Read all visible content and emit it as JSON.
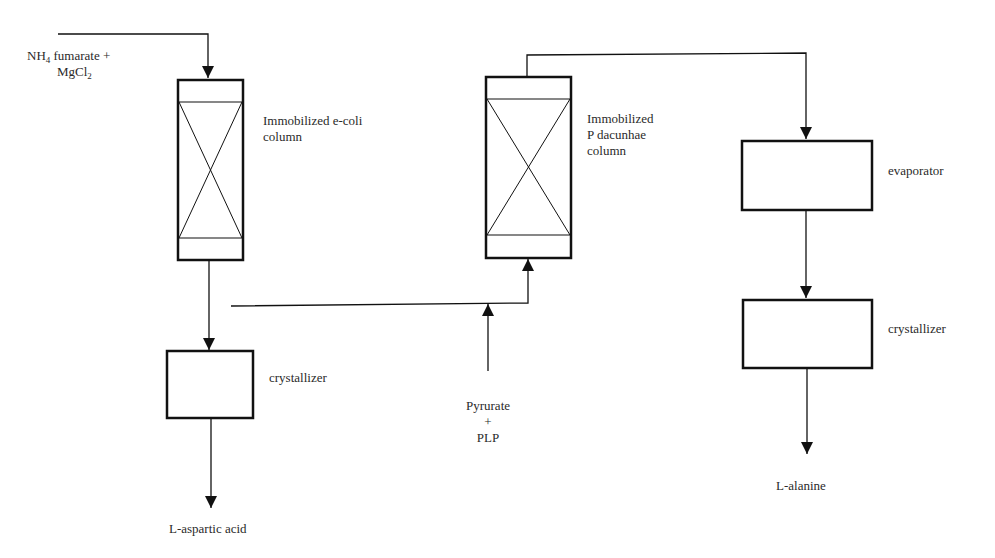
{
  "diagram": {
    "type": "process-flow",
    "inputs": {
      "feed1": {
        "line1_prefix": "NH",
        "line1_sub": "4",
        "line1_suffix": " fumarate  +",
        "line2_prefix": "MgCl",
        "line2_sub": "2"
      },
      "feed2": {
        "line1": "Pyrurate",
        "line2": "+",
        "line3": "PLP"
      }
    },
    "units": {
      "column1": {
        "line1": "Immobilized e-coli",
        "line2": "column"
      },
      "column2": {
        "line1": "Immobilized",
        "line2": "P dacunhae",
        "line3": "column"
      },
      "crystallizer1": {
        "label": "crystallizer"
      },
      "evaporator": {
        "label": "evaporator"
      },
      "crystallizer2": {
        "label": "crystallizer"
      }
    },
    "outputs": {
      "product1": "L-aspartic acid",
      "product2": "L-alanine"
    },
    "colors": {
      "stroke": "#111111",
      "background": "#ffffff"
    }
  }
}
